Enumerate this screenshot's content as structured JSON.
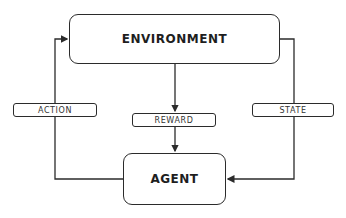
{
  "diagram": {
    "type": "reinforcement-learning-loop",
    "nodes": {
      "environment": "ENVIRONMENT",
      "agent": "AGENT"
    },
    "edges": {
      "action": "ACTION",
      "reward": "REWARD",
      "state": "STATE"
    },
    "colors": {
      "stroke": "#2b2b2b",
      "background": "#ffffff",
      "text": "#1e1e1e"
    }
  }
}
